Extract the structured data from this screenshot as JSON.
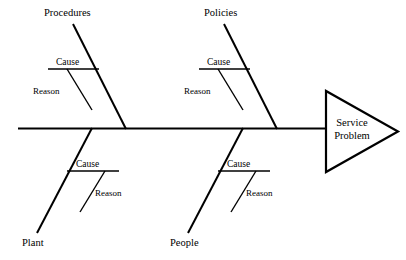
{
  "diagram": {
    "type": "fishbone-ishikawa-diagram",
    "title_text": "Service Problem",
    "stroke_color": "#000000",
    "background_color": "#ffffff",
    "head": {
      "label_line_1": "Service",
      "label_line_2": "Problem"
    },
    "spine": {
      "label": "spine"
    },
    "branches": [
      {
        "id": "procedures",
        "category_label": "Procedures",
        "position": "top",
        "cause_label": "Cause",
        "reason_label": "Reason"
      },
      {
        "id": "policies",
        "category_label": "Policies",
        "position": "top",
        "cause_label": "Cause",
        "reason_label": "Reason"
      },
      {
        "id": "plant",
        "category_label": "Plant",
        "position": "bottom",
        "cause_label": "Cause",
        "reason_label": "Reason"
      },
      {
        "id": "people",
        "category_label": "People",
        "position": "bottom",
        "cause_label": "Cause",
        "reason_label": "Reason"
      }
    ]
  }
}
